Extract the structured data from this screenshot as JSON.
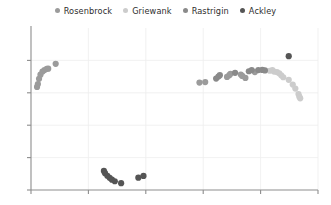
{
  "legend": {
    "position": "top-center",
    "entries": [
      {
        "label": "Rosenbrock",
        "color": "#9b9b9b",
        "icon": "circle-marker-icon"
      },
      {
        "label": "Griewank",
        "color": "#cccccc",
        "icon": "circle-marker-icon"
      },
      {
        "label": "Rastrigin",
        "color": "#8a8a8a",
        "icon": "circle-marker-icon"
      },
      {
        "label": "Ackley",
        "color": "#555555",
        "icon": "circle-marker-icon"
      }
    ]
  },
  "chart_data": {
    "type": "scatter",
    "title": "",
    "xlabel": "",
    "ylabel": "",
    "grid": true,
    "legend_position": "top-center",
    "xlim": [
      0,
      5
    ],
    "ylim": [
      0,
      5
    ],
    "xticks": [
      0,
      1,
      2,
      3,
      4,
      5
    ],
    "yticks": [
      0,
      1,
      2,
      3,
      4
    ],
    "xticklabels": [
      "",
      "",
      "",
      "",
      "",
      ""
    ],
    "yticklabels": [
      "",
      "",
      "",
      "",
      ""
    ],
    "series": [
      {
        "name": "Rosenbrock",
        "color": "#9b9b9b",
        "points": [
          {
            "x": 0.105,
            "y": 3.18
          },
          {
            "x": 0.12,
            "y": 3.27
          },
          {
            "x": 0.14,
            "y": 3.43
          },
          {
            "x": 0.165,
            "y": 3.56
          },
          {
            "x": 0.2,
            "y": 3.655
          },
          {
            "x": 0.235,
            "y": 3.7
          },
          {
            "x": 0.275,
            "y": 3.74
          },
          {
            "x": 0.3,
            "y": 3.745
          },
          {
            "x": 0.43,
            "y": 3.895
          },
          {
            "x": 2.935,
            "y": 3.315
          },
          {
            "x": 3.035,
            "y": 3.33
          },
          {
            "x": 3.415,
            "y": 3.49
          },
          {
            "x": 3.455,
            "y": 3.545
          },
          {
            "x": 3.475,
            "y": 3.585
          },
          {
            "x": 3.655,
            "y": 3.565
          },
          {
            "x": 3.68,
            "y": 3.52
          },
          {
            "x": 3.735,
            "y": 3.46
          },
          {
            "x": 3.9,
            "y": 3.64
          }
        ]
      },
      {
        "name": "Griewank",
        "color": "#cccccc",
        "points": [
          {
            "x": 4.16,
            "y": 3.68
          },
          {
            "x": 4.205,
            "y": 3.7
          },
          {
            "x": 4.235,
            "y": 3.655
          },
          {
            "x": 4.285,
            "y": 3.64
          },
          {
            "x": 4.325,
            "y": 3.6
          },
          {
            "x": 4.36,
            "y": 3.54
          },
          {
            "x": 4.395,
            "y": 3.48
          },
          {
            "x": 4.49,
            "y": 3.4
          },
          {
            "x": 4.56,
            "y": 3.255
          },
          {
            "x": 4.605,
            "y": 3.13
          },
          {
            "x": 4.66,
            "y": 2.96
          },
          {
            "x": 4.675,
            "y": 2.88
          },
          {
            "x": 4.69,
            "y": 2.83
          }
        ]
      },
      {
        "name": "Rastrigin",
        "color": "#8a8a8a",
        "points": [
          {
            "x": 3.225,
            "y": 3.44
          },
          {
            "x": 3.265,
            "y": 3.5
          },
          {
            "x": 3.29,
            "y": 3.545
          },
          {
            "x": 3.555,
            "y": 3.615
          },
          {
            "x": 3.795,
            "y": 3.665
          },
          {
            "x": 3.845,
            "y": 3.7
          },
          {
            "x": 3.96,
            "y": 3.7
          },
          {
            "x": 4.03,
            "y": 3.705
          },
          {
            "x": 4.075,
            "y": 3.69
          }
        ]
      },
      {
        "name": "Ackley",
        "color": "#555555",
        "points": [
          {
            "x": 1.27,
            "y": 0.59
          },
          {
            "x": 1.29,
            "y": 0.52
          },
          {
            "x": 1.33,
            "y": 0.44
          },
          {
            "x": 1.37,
            "y": 0.375
          },
          {
            "x": 1.41,
            "y": 0.32
          },
          {
            "x": 1.46,
            "y": 0.27
          },
          {
            "x": 1.57,
            "y": 0.21
          },
          {
            "x": 1.87,
            "y": 0.38
          },
          {
            "x": 1.96,
            "y": 0.435
          },
          {
            "x": 4.49,
            "y": 4.13
          }
        ]
      }
    ]
  }
}
